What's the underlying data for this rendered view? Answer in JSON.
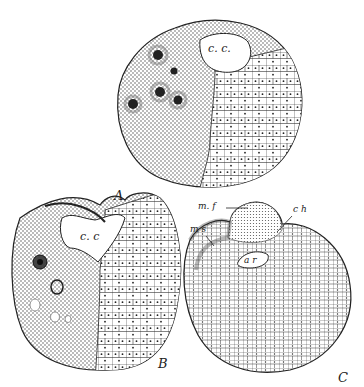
{
  "figures": [
    {
      "id": "A",
      "label": "A",
      "cavity_label": "c. c."
    },
    {
      "id": "B",
      "label": "B",
      "cavity_label": "c. c"
    },
    {
      "id": "C",
      "label": "C",
      "annotations": [
        "m. f",
        "c h",
        "m s",
        "a r"
      ]
    }
  ],
  "colors": {
    "ink": "#222222",
    "paper": "#ffffff",
    "stipple": "#555555"
  }
}
